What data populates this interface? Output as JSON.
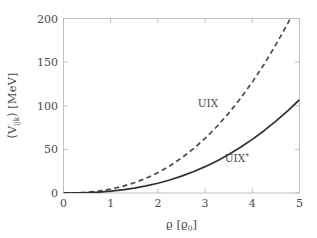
{
  "chart_data": {
    "type": "line",
    "title": "",
    "xlabel": "ϱ [ϱ₀]",
    "ylabel": "⟨Vᵢⱼₖ⟩ [MeV]",
    "xlim": [
      0,
      5
    ],
    "ylim": [
      0,
      200
    ],
    "xticks": [
      0,
      1,
      2,
      3,
      4,
      5
    ],
    "yticks": [
      0,
      50,
      100,
      150,
      200
    ],
    "xtick_labels": [
      "0",
      "1",
      "2",
      "3",
      "4",
      "5"
    ],
    "ytick_labels": [
      "0",
      "50",
      "100",
      "150",
      "200"
    ],
    "grid": false,
    "legend_position": "inline-annotations",
    "x": [
      0,
      0.25,
      0.5,
      0.75,
      1.0,
      1.25,
      1.5,
      1.75,
      2.0,
      2.25,
      2.5,
      2.75,
      3.0,
      3.25,
      3.5,
      3.75,
      4.0,
      4.25,
      4.5,
      4.75,
      5.0
    ],
    "series": [
      {
        "name": "UIX",
        "style": "dashed",
        "color": "#4a4a4a",
        "values": [
          0.0,
          0.2,
          0.9,
          2.3,
          4.5,
          7.6,
          11.7,
          16.9,
          23.3,
          31.0,
          40.1,
          50.6,
          62.6,
          76.2,
          91.5,
          108.4,
          127.1,
          147.6,
          170.0,
          194.2,
          220.3
        ]
      },
      {
        "name": "UIX*",
        "style": "solid",
        "color": "#2f2f2f",
        "values": [
          0.0,
          0.1,
          0.45,
          1.1,
          2.1,
          3.6,
          5.6,
          8.1,
          11.2,
          14.9,
          19.3,
          24.4,
          30.2,
          36.8,
          44.2,
          52.4,
          61.5,
          71.4,
          82.3,
          94.1,
          106.9
        ]
      }
    ],
    "annotations": [
      {
        "text": "UIX",
        "x_data": 3.35,
        "y_data": 100.0
      },
      {
        "text": "UIX*",
        "x_data": 4.05,
        "y_data": 27.0
      }
    ]
  },
  "axis": {
    "y_label_main": "⟨V",
    "y_label_sub": "ijk",
    "y_label_close": "⟩ [MeV]",
    "x_label_rho": "ϱ",
    "x_label_bracket_open": " [",
    "x_label_rho0": "ϱ",
    "x_label_sub0": "0",
    "x_label_bracket_close": "]"
  },
  "labels": {
    "uix": "UIX",
    "uix_star": "UIX",
    "star_glyph": "*"
  },
  "colors": {
    "frame": "#b9b9b9",
    "solid_curve": "#2f2f2f",
    "dashed_curve": "#4a4a4a",
    "text": "#4a4a4a",
    "background": "#ffffff"
  }
}
